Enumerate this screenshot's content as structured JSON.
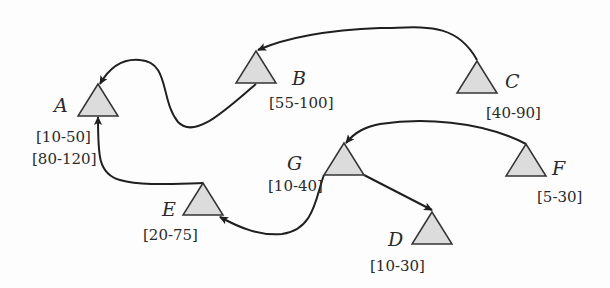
{
  "diagram": {
    "type": "directed-graph",
    "node_shape": "triangle",
    "colors": {
      "node_fill": "#dcdcdc",
      "node_stroke": "#333333",
      "edge": "#1f1f1f",
      "background": "#fdfdfd"
    },
    "nodes": [
      {
        "id": "A",
        "label": "A",
        "ranges": [
          "[10-50]",
          "[80-120]"
        ]
      },
      {
        "id": "B",
        "label": "B",
        "ranges": [
          "[55-100]"
        ]
      },
      {
        "id": "C",
        "label": "C",
        "ranges": [
          "[40-90]"
        ]
      },
      {
        "id": "D",
        "label": "D",
        "ranges": [
          "[10-30]"
        ]
      },
      {
        "id": "E",
        "label": "E",
        "ranges": [
          "[20-75]"
        ]
      },
      {
        "id": "F",
        "label": "F",
        "ranges": [
          "[5-30]"
        ]
      },
      {
        "id": "G",
        "label": "G",
        "ranges": [
          "[10-40]"
        ]
      }
    ],
    "edges": [
      {
        "from": "C",
        "to": "B"
      },
      {
        "from": "B",
        "to": "A"
      },
      {
        "from": "E",
        "to": "A"
      },
      {
        "from": "F",
        "to": "G"
      },
      {
        "from": "G",
        "to": "D"
      },
      {
        "from": "G",
        "to": "E"
      }
    ]
  }
}
